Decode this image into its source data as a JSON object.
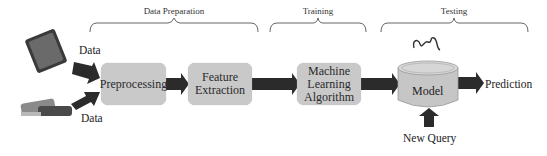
{
  "stages": [
    {
      "label": "Data Preparation"
    },
    {
      "label": "Training"
    },
    {
      "label": "Testing"
    }
  ],
  "inputs": [
    {
      "label": "Data",
      "icon": "smartphone-icon"
    },
    {
      "label": "Data",
      "icon": "wristband-icon"
    }
  ],
  "process": [
    {
      "label": "Preprocessing"
    },
    {
      "label": "Feature Extraction"
    },
    {
      "label": "Machine Learning Algorithm"
    }
  ],
  "model": {
    "label": "Model",
    "icon": "signal-waveform-icon"
  },
  "output": {
    "label": "Prediction"
  },
  "query": {
    "label": "New Query"
  },
  "colors": {
    "box_fill": "#c9c9c9",
    "arrow": "#2b2b2b",
    "bracket": "#555555"
  }
}
